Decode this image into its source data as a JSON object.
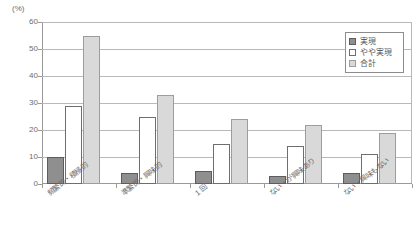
{
  "chart_data": {
    "type": "bar",
    "title": "",
    "subtitle": "",
    "xlabel": "",
    "ylabel": "",
    "unit_label": "(%)",
    "ylim": [
      0,
      60
    ],
    "ytick_step": 10,
    "yticks": [
      0,
      10,
      20,
      30,
      40,
      50,
      60
    ],
    "ytick_labels": [
      "0",
      "10",
      "20",
      "30",
      "40",
      "50",
      "60"
    ],
    "grid": true,
    "grid_axis": "y",
    "legend_position": "top-right",
    "categories": [
      "頻繁的・積極的",
      "準繁的・興味的",
      "1 回",
      "ない・が興味あり",
      "ない・興味もない"
    ],
    "series": [
      {
        "name": "実現",
        "color": "#8f8f8f",
        "values": [
          10,
          4,
          5,
          3,
          4
        ]
      },
      {
        "name": "やや実現",
        "color": "#ffffff",
        "values": [
          29,
          25,
          15,
          14,
          11
        ]
      },
      {
        "name": "合計",
        "color": "#d9d9d9",
        "values": [
          55,
          33,
          24,
          22,
          19
        ]
      }
    ]
  },
  "legend": {
    "items": [
      {
        "label": "実現"
      },
      {
        "label": "やや実現"
      },
      {
        "label": "合計"
      }
    ]
  }
}
